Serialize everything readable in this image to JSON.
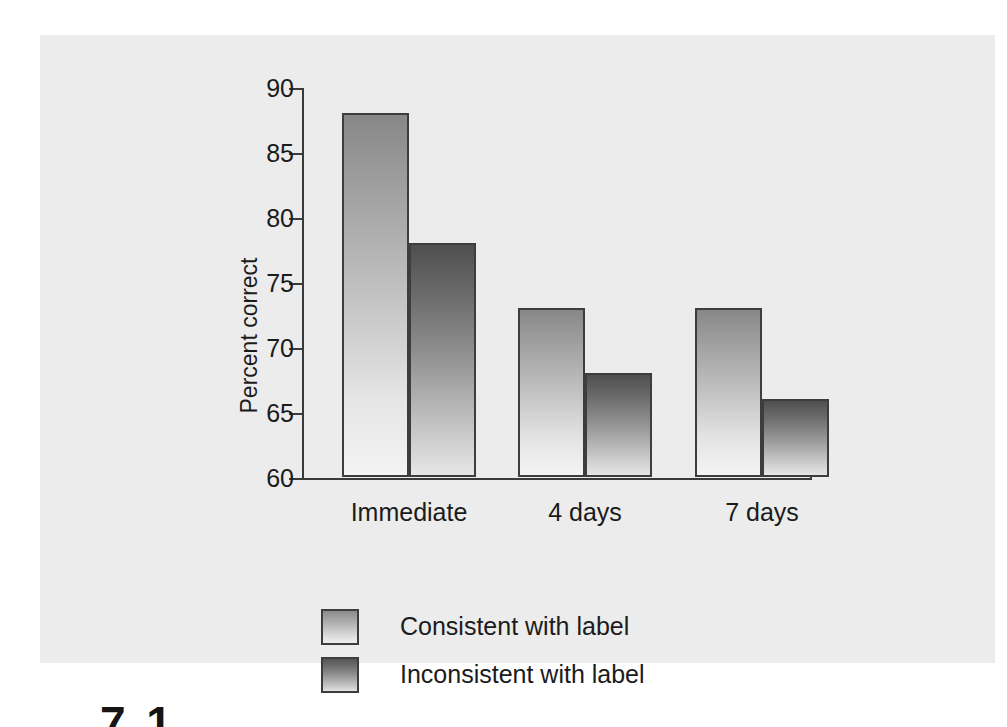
{
  "figure": {
    "background_color": "#ececec",
    "page_color": "#ffffff",
    "caption_stub": "7.1"
  },
  "chart_data": {
    "type": "bar",
    "title": "",
    "subtitle": "",
    "xlabel": "",
    "ylabel": "Percent correct",
    "categories": [
      "Immediate",
      "4 days",
      "7 days"
    ],
    "series": [
      {
        "name": "Consistent with label",
        "values": [
          88,
          73,
          73
        ],
        "color": "#9d9d9d",
        "gradient_top": "#878787",
        "gradient_bottom": "#f4f4f4"
      },
      {
        "name": "Inconsistent with label",
        "values": [
          78,
          68,
          66
        ],
        "color": "#6b6b6b",
        "gradient_top": "#4f4f4f",
        "gradient_bottom": "#e6e6e6"
      }
    ],
    "ylim": [
      60,
      90
    ],
    "yticks": [
      60,
      65,
      70,
      75,
      80,
      85,
      90
    ],
    "ytick_labels": [
      "60",
      "65",
      "70",
      "75",
      "80",
      "85",
      "90"
    ],
    "grid": false,
    "legend_position": "bottom-left",
    "bar_edge_color": "#3d3d3d",
    "axis_color": "#3a3a3a"
  }
}
